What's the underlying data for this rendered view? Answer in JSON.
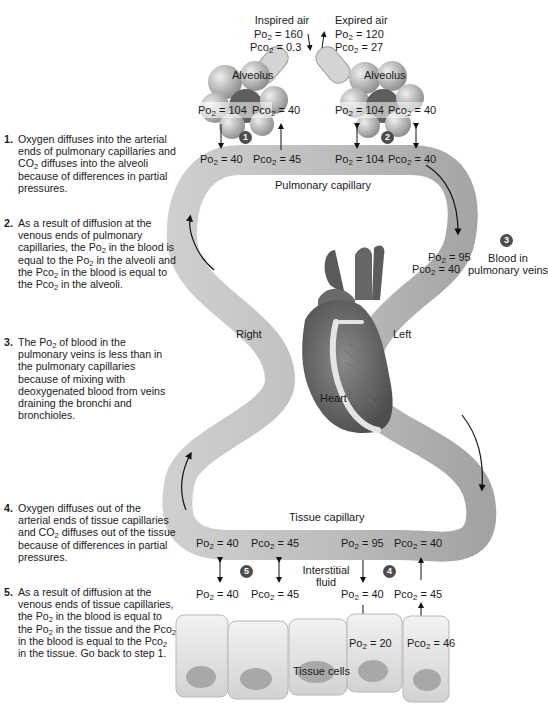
{
  "air": {
    "inspired": {
      "label": "Inspired air",
      "po2": "160",
      "pco2": "0.3"
    },
    "expired": {
      "label": "Expired air",
      "po2": "120",
      "pco2": "27"
    }
  },
  "alveoli": {
    "left": {
      "label": "Alveolus",
      "po2": "104",
      "pco2": "40"
    },
    "right": {
      "label": "Alveolus",
      "po2": "104",
      "pco2": "40"
    }
  },
  "pulmonary_capillary": {
    "label": "Pulmonary capillary",
    "arterial": {
      "po2": "40",
      "pco2": "45"
    },
    "venous": {
      "po2": "104",
      "pco2": "40"
    }
  },
  "pulmonary_veins": {
    "badge": "3",
    "label_line1": "Blood in",
    "label_line2": "pulmonary veins",
    "po2": "95",
    "pco2": "40"
  },
  "heart": {
    "label": "Heart",
    "right": "Right",
    "left": "Left"
  },
  "tissue_capillary": {
    "label": "Tissue capillary",
    "arterial": {
      "po2": "95",
      "pco2": "40"
    },
    "venous": {
      "po2": "40",
      "pco2": "45"
    }
  },
  "interstitial": {
    "label_line1": "Interstitial",
    "label_line2": "fluid",
    "left": {
      "po2": "40",
      "pco2": "45"
    },
    "right": {
      "po2": "40",
      "pco2": "45"
    }
  },
  "tissue_cells": {
    "label": "Tissue cells",
    "po2": "20",
    "pco2": "46"
  },
  "badges": {
    "b1": "1",
    "b2": "2",
    "b3": "3",
    "b4": "4",
    "b5": "5"
  },
  "terms": {
    "po2": "Po",
    "pco2": "Pco",
    "sub": "2",
    "eq": " = "
  },
  "steps": [
    {
      "num": "1.",
      "parts": [
        "Oxygen diffuses into the arterial ends of pulmonary capillaries and CO",
        "2",
        " diffuses into the alveoli because of differences in partial pressures."
      ]
    },
    {
      "num": "2.",
      "parts": [
        "As a result of diffusion at the venous ends of pulmonary capillaries, the Po",
        "2",
        " in the blood is equal to the Po",
        "2",
        " in the alveoli and the Pco",
        "2",
        " in the blood is equal to the Pco",
        "2",
        " in the alveoli."
      ]
    },
    {
      "num": "3.",
      "parts": [
        "The Po",
        "2",
        " of blood in the pulmonary veins is less than in the pulmonary capillaries because of mixing with deoxygenated blood from veins draining the bronchi and bronchioles."
      ]
    },
    {
      "num": "4.",
      "parts": [
        "Oxygen diffuses out of the arterial ends of tissue capillaries and CO",
        "2",
        " diffuses out of the tissue because of differences in partial pressures."
      ]
    },
    {
      "num": "5.",
      "parts": [
        "As a result of diffusion at the venous ends of tissue capillaries, the Po",
        "2",
        " in the blood  is equal to the Po",
        "2",
        " in the tissue and the Pco",
        "2",
        " in the blood is equal to the Pco",
        "2",
        " in the tissue. Go back to step 1."
      ]
    }
  ]
}
